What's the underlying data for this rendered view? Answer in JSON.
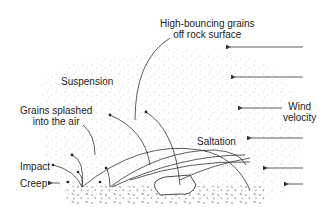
{
  "diagram": {
    "type": "aeolian sediment transport schematic",
    "labels": {
      "high_bouncing_line1": "High-bouncing grains",
      "high_bouncing_line2": "off rock surface",
      "suspension": "Suspension",
      "grains_splashed_line1": "Grains splashed",
      "grains_splashed_line2": "into the air",
      "wind_line1": "Wind",
      "wind_line2": "velocity",
      "saltation": "Saltation",
      "impact": "Impact",
      "creep": "Creep"
    },
    "wind_arrows": [
      {
        "y": 47,
        "x_start": 303,
        "x_end": 226
      },
      {
        "y": 77,
        "x_start": 303,
        "x_end": 231
      },
      {
        "y": 108,
        "x_start": 280,
        "x_end": 238
      },
      {
        "y": 138,
        "x_start": 303,
        "x_end": 247
      },
      {
        "y": 168,
        "x_start": 303,
        "x_end": 263
      },
      {
        "y": 184,
        "x_start": 303,
        "x_end": 284
      }
    ],
    "colors": {
      "line": "#333333",
      "stipple": "#b0b0b0",
      "text": "#222222"
    }
  }
}
